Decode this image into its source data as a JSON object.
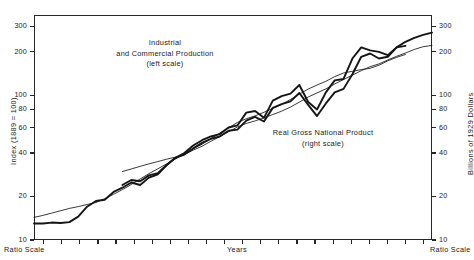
{
  "chart_data": {
    "type": "line",
    "title": "",
    "xlabel": "Years",
    "ylabel": "Index (1889 = 100)",
    "ylabel_right": "Billions of 1929 Dollars",
    "scale_note_left": "Ratio Scale",
    "scale_note_right": "Ratio Scale",
    "yscale": "log",
    "ylim": [
      10,
      360
    ],
    "yticks": [
      300,
      200,
      100,
      80,
      60,
      40,
      20,
      10
    ],
    "yticks_right": [
      300,
      200,
      100,
      80,
      60,
      40,
      20,
      10
    ],
    "grid": false,
    "legend": "inline-annotations",
    "xticks_labeled": false,
    "xtick_count": 22,
    "annotations": [
      {
        "name": "industrial-production-label",
        "lines": [
          "Industrial",
          "and Commercial Production",
          "(left scale)"
        ]
      },
      {
        "name": "real-gnp-label",
        "lines": [
          "Real Gross National Product",
          "(right scale)"
        ]
      }
    ],
    "series": [
      {
        "name": "Industrial and Commercial Production",
        "axis": "left",
        "units": "Index (1889 = 100)",
        "points": [
          [
            1869,
            13
          ],
          [
            1871,
            13
          ],
          [
            1873,
            13.2
          ],
          [
            1875,
            13.1
          ],
          [
            1877,
            13.3
          ],
          [
            1879,
            14.5
          ],
          [
            1881,
            17.0
          ],
          [
            1883,
            18.6
          ],
          [
            1885,
            19.0
          ],
          [
            1887,
            21.5
          ],
          [
            1889,
            23.0
          ],
          [
            1891,
            25.0
          ],
          [
            1893,
            24.0
          ],
          [
            1895,
            27.0
          ],
          [
            1897,
            28.5
          ],
          [
            1899,
            33.0
          ],
          [
            1901,
            37.0
          ],
          [
            1903,
            40.0
          ],
          [
            1905,
            45.0
          ],
          [
            1907,
            49.0
          ],
          [
            1909,
            52.0
          ],
          [
            1911,
            54.0
          ],
          [
            1913,
            60.0
          ],
          [
            1915,
            62.0
          ],
          [
            1917,
            76.0
          ],
          [
            1919,
            78.0
          ],
          [
            1921,
            70.0
          ],
          [
            1923,
            92.0
          ],
          [
            1925,
            99.0
          ],
          [
            1927,
            103.0
          ],
          [
            1929,
            118.0
          ],
          [
            1931,
            90.0
          ],
          [
            1933,
            80.0
          ],
          [
            1935,
            105.0
          ],
          [
            1937,
            127.0
          ],
          [
            1939,
            130.0
          ],
          [
            1941,
            180.0
          ],
          [
            1943,
            215.0
          ],
          [
            1945,
            205.0
          ],
          [
            1947,
            200.0
          ],
          [
            1949,
            190.0
          ],
          [
            1951,
            215.0
          ],
          [
            1953,
            220.0
          ]
        ]
      },
      {
        "name": "Real Gross National Product",
        "axis": "right",
        "units": "Billions of 1929 Dollars",
        "points": [
          [
            1889,
            24.0
          ],
          [
            1891,
            26.0
          ],
          [
            1893,
            25.5
          ],
          [
            1895,
            28.0
          ],
          [
            1897,
            29.0
          ],
          [
            1899,
            33.0
          ],
          [
            1901,
            37.0
          ],
          [
            1903,
            39.0
          ],
          [
            1905,
            43.0
          ],
          [
            1907,
            47.0
          ],
          [
            1909,
            50.0
          ],
          [
            1911,
            52.0
          ],
          [
            1913,
            57.0
          ],
          [
            1915,
            58.0
          ],
          [
            1917,
            67.0
          ],
          [
            1919,
            71.0
          ],
          [
            1921,
            66.0
          ],
          [
            1923,
            82.0
          ],
          [
            1925,
            87.0
          ],
          [
            1927,
            91.0
          ],
          [
            1929,
            104.0
          ],
          [
            1931,
            86.0
          ],
          [
            1933,
            72.0
          ],
          [
            1935,
            88.0
          ],
          [
            1937,
            105.0
          ],
          [
            1939,
            111.0
          ],
          [
            1941,
            140.0
          ],
          [
            1943,
            185.0
          ],
          [
            1945,
            195.0
          ],
          [
            1947,
            180.0
          ],
          [
            1949,
            185.0
          ],
          [
            1951,
            215.0
          ],
          [
            1953,
            235.0
          ],
          [
            1955,
            250.0
          ],
          [
            1957,
            262.0
          ],
          [
            1959,
            272.0
          ]
        ]
      }
    ],
    "trend_lines": [
      {
        "name": "industrial-production-trend",
        "for": "Industrial and Commercial Production"
      },
      {
        "name": "real-gnp-trend",
        "for": "Real Gross National Product"
      }
    ]
  }
}
